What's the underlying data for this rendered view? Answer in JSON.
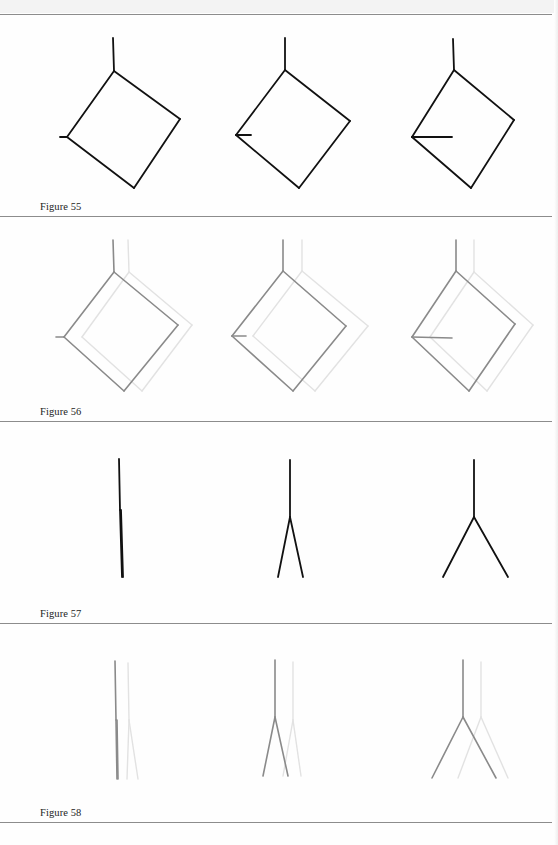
{
  "page": {
    "rules_y": [
      14,
      216,
      421,
      623,
      822
    ],
    "colors": {
      "ink": "#111111",
      "gray_ink": "#8a8a8a",
      "ghost_ink": "#e2e2e2",
      "rule": "#8c8c8c"
    }
  },
  "figures": [
    {
      "label": "Figure 55",
      "caption_top": 201,
      "top": 14,
      "height": 202,
      "style": "solid-black",
      "panels": [
        {
          "main": [
            [
              [
                113,
                38
              ],
              [
                114,
                71
              ]
            ],
            [
              [
                114,
                71
              ],
              [
                180,
                119
              ]
            ],
            [
              [
                180,
                119
              ],
              [
                134,
                188
              ]
            ],
            [
              [
                134,
                188
              ],
              [
                67,
                137
              ]
            ],
            [
              [
                67,
                137
              ],
              [
                114,
                71
              ]
            ],
            [
              [
                60,
                137
              ],
              [
                67,
                137
              ]
            ]
          ]
        },
        {
          "main": [
            [
              [
                285,
                38
              ],
              [
                285,
                70
              ]
            ],
            [
              [
                285,
                70
              ],
              [
                350,
                121
              ]
            ],
            [
              [
                350,
                121
              ],
              [
                299,
                188
              ]
            ],
            [
              [
                299,
                188
              ],
              [
                236,
                135
              ]
            ],
            [
              [
                236,
                135
              ],
              [
                285,
                70
              ]
            ],
            [
              [
                236,
                135
              ],
              [
                251,
                135
              ]
            ]
          ]
        },
        {
          "main": [
            [
              [
                453,
                39
              ],
              [
                454,
                70
              ]
            ],
            [
              [
                454,
                70
              ],
              [
                514,
                120
              ]
            ],
            [
              [
                514,
                120
              ],
              [
                471,
                188
              ]
            ],
            [
              [
                471,
                188
              ],
              [
                412,
                137
              ]
            ],
            [
              [
                412,
                137
              ],
              [
                454,
                70
              ]
            ],
            [
              [
                412,
                137
              ],
              [
                452,
                137
              ]
            ]
          ]
        }
      ]
    },
    {
      "label": "Figure 56",
      "caption_top": 406,
      "top": 216,
      "height": 205,
      "style": "gray-with-ghost",
      "panels": [
        {
          "main": [
            [
              [
                113,
                240
              ],
              [
                114,
                272
              ]
            ],
            [
              [
                114,
                272
              ],
              [
                178,
                325
              ]
            ],
            [
              [
                178,
                325
              ],
              [
                124,
                391
              ]
            ],
            [
              [
                124,
                391
              ],
              [
                64,
                337
              ]
            ],
            [
              [
                64,
                337
              ],
              [
                114,
                272
              ]
            ],
            [
              [
                56,
                337
              ],
              [
                64,
                337
              ]
            ]
          ],
          "ghost": [
            [
              [
                128,
                240
              ],
              [
                129,
                272
              ]
            ],
            [
              [
                129,
                272
              ],
              [
                192,
                325
              ]
            ],
            [
              [
                192,
                325
              ],
              [
                142,
                391
              ]
            ],
            [
              [
                142,
                391
              ],
              [
                82,
                337
              ]
            ],
            [
              [
                82,
                337
              ],
              [
                129,
                272
              ]
            ]
          ]
        },
        {
          "main": [
            [
              [
                283,
                240
              ],
              [
                283,
                271
              ]
            ],
            [
              [
                283,
                271
              ],
              [
                346,
                326
              ]
            ],
            [
              [
                346,
                326
              ],
              [
                293,
                391
              ]
            ],
            [
              [
                293,
                391
              ],
              [
                232,
                336
              ]
            ],
            [
              [
                232,
                336
              ],
              [
                283,
                271
              ]
            ],
            [
              [
                232,
                336
              ],
              [
                246,
                336
              ]
            ]
          ],
          "ghost": [
            [
              [
                302,
                240
              ],
              [
                302,
                271
              ]
            ],
            [
              [
                302,
                271
              ],
              [
                368,
                326
              ]
            ],
            [
              [
                368,
                326
              ],
              [
                315,
                391
              ]
            ],
            [
              [
                315,
                391
              ],
              [
                253,
                336
              ]
            ],
            [
              [
                253,
                336
              ],
              [
                302,
                271
              ]
            ]
          ]
        },
        {
          "main": [
            [
              [
                456,
                240
              ],
              [
                456,
                271
              ]
            ],
            [
              [
                456,
                271
              ],
              [
                515,
                324
              ]
            ],
            [
              [
                515,
                324
              ],
              [
                469,
                391
              ]
            ],
            [
              [
                469,
                391
              ],
              [
                412,
                337
              ]
            ],
            [
              [
                412,
                337
              ],
              [
                456,
                271
              ]
            ],
            [
              [
                412,
                337
              ],
              [
                452,
                338
              ]
            ]
          ],
          "ghost": [
            [
              [
                474,
                240
              ],
              [
                474,
                272
              ]
            ],
            [
              [
                474,
                272
              ],
              [
                533,
                325
              ]
            ],
            [
              [
                533,
                325
              ],
              [
                487,
                391
              ]
            ],
            [
              [
                487,
                391
              ],
              [
                430,
                337
              ]
            ],
            [
              [
                430,
                337
              ],
              [
                474,
                272
              ]
            ]
          ]
        }
      ]
    },
    {
      "label": "Figure 57",
      "caption_top": 608,
      "top": 421,
      "height": 202,
      "style": "solid-black",
      "panels": [
        {
          "main": [
            [
              [
                119,
                459
              ],
              [
                120,
                510
              ]
            ],
            [
              [
                120,
                510
              ],
              [
                122,
                577
              ]
            ],
            [
              [
                121,
                510
              ],
              [
                123,
                577
              ]
            ]
          ]
        },
        {
          "main": [
            [
              [
                290,
                460
              ],
              [
                290,
                517
              ]
            ],
            [
              [
                290,
                517
              ],
              [
                278,
                577
              ]
            ],
            [
              [
                290,
                517
              ],
              [
                303,
                577
              ]
            ]
          ]
        },
        {
          "main": [
            [
              [
                474,
                460
              ],
              [
                474,
                517
              ]
            ],
            [
              [
                474,
                517
              ],
              [
                443,
                577
              ]
            ],
            [
              [
                474,
                517
              ],
              [
                508,
                577
              ]
            ]
          ]
        }
      ]
    },
    {
      "label": "Figure 58",
      "caption_top": 807,
      "top": 623,
      "height": 199,
      "style": "gray-with-ghost",
      "panels": [
        {
          "main": [
            [
              [
                115,
                661
              ],
              [
                116,
                720
              ]
            ],
            [
              [
                116,
                720
              ],
              [
                117,
                779
              ]
            ],
            [
              [
                117,
                720
              ],
              [
                118,
                779
              ]
            ]
          ],
          "ghost": [
            [
              [
                128,
                663
              ],
              [
                129,
                720
              ]
            ],
            [
              [
                129,
                720
              ],
              [
                127,
                779
              ]
            ],
            [
              [
                129,
                720
              ],
              [
                138,
                779
              ]
            ]
          ]
        },
        {
          "main": [
            [
              [
                275,
                660
              ],
              [
                275,
                717
              ]
            ],
            [
              [
                275,
                717
              ],
              [
                263,
                776
              ]
            ],
            [
              [
                275,
                717
              ],
              [
                288,
                776
              ]
            ]
          ],
          "ghost": [
            [
              [
                293,
                662
              ],
              [
                293,
                720
              ]
            ],
            [
              [
                293,
                720
              ],
              [
                283,
                776
              ]
            ],
            [
              [
                293,
                720
              ],
              [
                301,
                776
              ]
            ]
          ]
        },
        {
          "main": [
            [
              [
                463,
                660
              ],
              [
                463,
                717
              ]
            ],
            [
              [
                463,
                717
              ],
              [
                432,
                778
              ]
            ],
            [
              [
                463,
                717
              ],
              [
                496,
                778
              ]
            ]
          ],
          "ghost": [
            [
              [
                481,
                662
              ],
              [
                481,
                717
              ]
            ],
            [
              [
                481,
                717
              ],
              [
                458,
                778
              ]
            ],
            [
              [
                481,
                717
              ],
              [
                508,
                778
              ]
            ]
          ]
        }
      ]
    }
  ]
}
